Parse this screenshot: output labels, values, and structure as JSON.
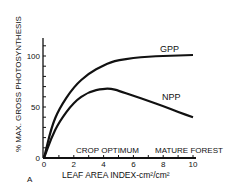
{
  "chart_data": {
    "type": "line",
    "title": "",
    "xlabel": "LEAF AREA INDEX-cm²/cm²",
    "ylabel": "% MAX. GROSS PHOTOSYNTHESIS",
    "panel_label": "A",
    "xlim": [
      0,
      10
    ],
    "ylim": [
      0,
      120
    ],
    "xticks": [
      "0",
      "2",
      "4",
      "6",
      "8",
      "10"
    ],
    "yticks": [
      "0",
      "50",
      "100"
    ],
    "grid": false,
    "x": [
      0,
      0.5,
      1,
      2,
      3,
      4,
      4.5,
      5,
      6,
      7,
      8,
      9,
      10
    ],
    "series": [
      {
        "name": "GPP",
        "values": [
          0,
          30,
          48,
          70,
          83,
          91,
          94,
          96,
          98,
          99.5,
          100,
          100.5,
          101
        ]
      },
      {
        "name": "NPP",
        "values": [
          0,
          20,
          35,
          55,
          65,
          68,
          68,
          66,
          61,
          56,
          51,
          45,
          40
        ]
      }
    ],
    "annotations": [
      "CROP OPTIMUM",
      "MATURE FOREST"
    ]
  }
}
